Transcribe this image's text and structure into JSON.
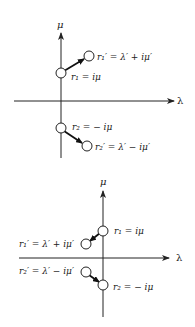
{
  "diagrams": [
    {
      "name": "top",
      "axes": {
        "vertical_label": "μ",
        "horizontal_label": "λ"
      },
      "roots": [
        {
          "id": "r1",
          "label": "r₁ = iμ"
        },
        {
          "id": "r1_prime",
          "label": "r₁′ = λ′ + iμ′"
        },
        {
          "id": "r2",
          "label": "r₂ = − iμ"
        },
        {
          "id": "r2_prime",
          "label": "r₂′ = λ′ − iμ′"
        }
      ]
    },
    {
      "name": "bottom",
      "axes": {
        "vertical_label": "μ",
        "horizontal_label": "λ"
      },
      "roots": [
        {
          "id": "r1",
          "label": "r₁ = iμ"
        },
        {
          "id": "r1_prime",
          "label": "r₁′ = λ′ + iμ′"
        },
        {
          "id": "r2",
          "label": "r₂ = − iμ"
        },
        {
          "id": "r2_prime",
          "label": "r₂′ = λ′ − iμ′"
        }
      ]
    }
  ]
}
